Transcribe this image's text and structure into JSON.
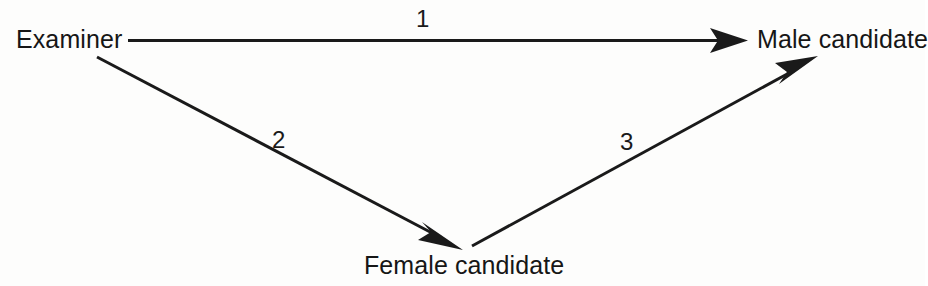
{
  "diagram": {
    "background_color": "#fdfdfc",
    "stroke_color": "#1a1a1a",
    "nodes": [
      {
        "id": "examiner",
        "label": "Examiner"
      },
      {
        "id": "male_candidate",
        "label": "Male candidate"
      },
      {
        "id": "female_candidate",
        "label": "Female candidate"
      }
    ],
    "edges": [
      {
        "id": "edge1",
        "label": "1",
        "from": "examiner",
        "to": "male_candidate",
        "direction": "right",
        "arrowhead": "filled-triangle"
      },
      {
        "id": "edge2",
        "label": "2",
        "from": "examiner",
        "to": "female_candidate",
        "direction": "down-right",
        "arrowhead": "filled-triangle"
      },
      {
        "id": "edge3",
        "label": "3",
        "from": "female_candidate",
        "to": "male_candidate",
        "direction": "up-right",
        "arrowhead": "filled-triangle"
      }
    ]
  }
}
